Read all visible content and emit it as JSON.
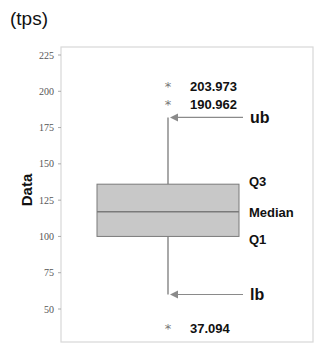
{
  "chart_data": {
    "type": "box",
    "title": "",
    "unit_label": "(tps)",
    "xlabel": "",
    "ylabel": "Data",
    "ylim": [
      40,
      230
    ],
    "yticks": [
      50,
      75,
      100,
      125,
      150,
      175,
      200,
      225
    ],
    "grid": false,
    "legend": null,
    "box": {
      "q1": 100,
      "median": 117,
      "q3": 136,
      "upper_whisker": 182,
      "lower_whisker": 60
    },
    "outliers": [
      203.973,
      190.962,
      37.094
    ],
    "outlier_labels": [
      "203.973",
      "190.962",
      "37.094"
    ],
    "annotations": {
      "ub": "ub",
      "q3": "Q3",
      "median": "Median",
      "q1": "Q1",
      "lb": "lb"
    },
    "colors": {
      "box_fill": "#c8c8c8",
      "box_stroke": "#7a7a7a",
      "whisker": "#7a7a7a",
      "arrow": "#8a8a8a",
      "frame": "#d8d8d8"
    }
  }
}
